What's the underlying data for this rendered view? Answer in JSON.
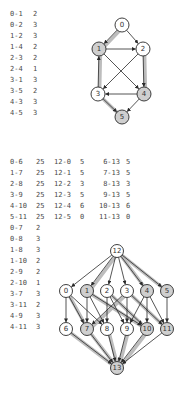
{
  "top": {
    "table": [
      {
        "edge": "0-1",
        "value": "2"
      },
      {
        "edge": "0-2",
        "value": "3"
      },
      {
        "edge": "1-2",
        "value": "3"
      },
      {
        "edge": "1-4",
        "value": "2"
      },
      {
        "edge": "2-3",
        "value": "2"
      },
      {
        "edge": "2-4",
        "value": "1"
      },
      {
        "edge": "3-1",
        "value": "3"
      },
      {
        "edge": "3-5",
        "value": "2"
      },
      {
        "edge": "4-3",
        "value": "3"
      },
      {
        "edge": "4-5",
        "value": "3"
      }
    ],
    "graph": {
      "nodes": [
        {
          "id": "0",
          "x": 122,
          "y": 25,
          "shaded": false
        },
        {
          "id": "1",
          "x": 99,
          "y": 49,
          "shaded": true
        },
        {
          "id": "2",
          "x": 143,
          "y": 49,
          "shaded": false
        },
        {
          "id": "3",
          "x": 98,
          "y": 94,
          "shaded": false
        },
        {
          "id": "4",
          "x": 144,
          "y": 94,
          "shaded": true
        },
        {
          "id": "5",
          "x": 122,
          "y": 117,
          "shaded": true
        }
      ],
      "edges": [
        {
          "from": "0",
          "to": "1",
          "highlight": true
        },
        {
          "from": "0",
          "to": "2",
          "highlight": false
        },
        {
          "from": "1",
          "to": "2",
          "highlight": false
        },
        {
          "from": "1",
          "to": "4",
          "highlight": false
        },
        {
          "from": "2",
          "to": "3",
          "highlight": false
        },
        {
          "from": "2",
          "to": "4",
          "highlight": true
        },
        {
          "from": "3",
          "to": "1",
          "highlight": true
        },
        {
          "from": "3",
          "to": "5",
          "highlight": true
        },
        {
          "from": "4",
          "to": "3",
          "highlight": false
        },
        {
          "from": "4",
          "to": "5",
          "highlight": false
        }
      ]
    }
  },
  "bottom": {
    "table_main": [
      [
        {
          "edge": "0-6",
          "value": "25"
        },
        {
          "edge": "12-0",
          "value": "5"
        },
        {
          "edge": "6-13",
          "value": "5"
        }
      ],
      [
        {
          "edge": "1-7",
          "value": "25"
        },
        {
          "edge": "12-1",
          "value": "5"
        },
        {
          "edge": "7-13",
          "value": "5"
        }
      ],
      [
        {
          "edge": "2-8",
          "value": "25"
        },
        {
          "edge": "12-2",
          "value": "3"
        },
        {
          "edge": "8-13",
          "value": "3"
        }
      ],
      [
        {
          "edge": "3-9",
          "value": "25"
        },
        {
          "edge": "12-3",
          "value": "5"
        },
        {
          "edge": "9-13",
          "value": "5"
        }
      ],
      [
        {
          "edge": "4-10",
          "value": "25"
        },
        {
          "edge": "12-4",
          "value": "6"
        },
        {
          "edge": "10-13",
          "value": "6"
        }
      ],
      [
        {
          "edge": "5-11",
          "value": "25"
        },
        {
          "edge": "12-5",
          "value": "0"
        },
        {
          "edge": "11-13",
          "value": "0"
        }
      ]
    ],
    "table_extra": [
      {
        "edge": "0-7",
        "value": "2"
      },
      {
        "edge": "0-8",
        "value": "3"
      },
      {
        "edge": "1-8",
        "value": "3"
      },
      {
        "edge": "1-10",
        "value": "2"
      },
      {
        "edge": "2-9",
        "value": "2"
      },
      {
        "edge": "2-10",
        "value": "1"
      },
      {
        "edge": "3-7",
        "value": "3"
      },
      {
        "edge": "3-11",
        "value": "2"
      },
      {
        "edge": "4-9",
        "value": "3"
      },
      {
        "edge": "4-11",
        "value": "3"
      }
    ],
    "graph": {
      "nodes": [
        {
          "id": "12",
          "x": 117,
          "y": 251,
          "shaded": false
        },
        {
          "id": "0",
          "x": 66,
          "y": 291,
          "shaded": false
        },
        {
          "id": "1",
          "x": 87,
          "y": 291,
          "shaded": true
        },
        {
          "id": "2",
          "x": 107,
          "y": 291,
          "shaded": false
        },
        {
          "id": "3",
          "x": 127,
          "y": 291,
          "shaded": false
        },
        {
          "id": "4",
          "x": 147,
          "y": 291,
          "shaded": true
        },
        {
          "id": "5",
          "x": 167,
          "y": 291,
          "shaded": true
        },
        {
          "id": "6",
          "x": 66,
          "y": 329,
          "shaded": false
        },
        {
          "id": "7",
          "x": 87,
          "y": 329,
          "shaded": true
        },
        {
          "id": "8",
          "x": 107,
          "y": 329,
          "shaded": false
        },
        {
          "id": "9",
          "x": 127,
          "y": 329,
          "shaded": false
        },
        {
          "id": "10",
          "x": 147,
          "y": 329,
          "shaded": true
        },
        {
          "id": "11",
          "x": 167,
          "y": 329,
          "shaded": true
        },
        {
          "id": "13",
          "x": 117,
          "y": 368,
          "shaded": true
        }
      ],
      "edges": [
        {
          "from": "12",
          "to": "0",
          "highlight": false
        },
        {
          "from": "12",
          "to": "1",
          "highlight": true
        },
        {
          "from": "12",
          "to": "2",
          "highlight": false
        },
        {
          "from": "12",
          "to": "3",
          "highlight": false
        },
        {
          "from": "12",
          "to": "4",
          "highlight": true
        },
        {
          "from": "12",
          "to": "5",
          "highlight": true
        },
        {
          "from": "0",
          "to": "6",
          "highlight": false
        },
        {
          "from": "1",
          "to": "7",
          "highlight": false
        },
        {
          "from": "2",
          "to": "8",
          "highlight": false
        },
        {
          "from": "3",
          "to": "9",
          "highlight": false
        },
        {
          "from": "4",
          "to": "10",
          "highlight": false
        },
        {
          "from": "5",
          "to": "11",
          "highlight": false
        },
        {
          "from": "0",
          "to": "7",
          "highlight": true
        },
        {
          "from": "0",
          "to": "8",
          "highlight": false
        },
        {
          "from": "1",
          "to": "8",
          "highlight": false
        },
        {
          "from": "1",
          "to": "10",
          "highlight": true
        },
        {
          "from": "2",
          "to": "9",
          "highlight": false
        },
        {
          "from": "2",
          "to": "10",
          "highlight": true
        },
        {
          "from": "3",
          "to": "7",
          "highlight": true
        },
        {
          "from": "3",
          "to": "11",
          "highlight": true
        },
        {
          "from": "4",
          "to": "9",
          "highlight": false
        },
        {
          "from": "4",
          "to": "11",
          "highlight": false
        },
        {
          "from": "6",
          "to": "13",
          "highlight": true
        },
        {
          "from": "7",
          "to": "13",
          "highlight": true
        },
        {
          "from": "8",
          "to": "13",
          "highlight": true
        },
        {
          "from": "9",
          "to": "13",
          "highlight": true
        },
        {
          "from": "10",
          "to": "13",
          "highlight": true
        },
        {
          "from": "11",
          "to": "13",
          "highlight": false
        }
      ]
    }
  },
  "colors": {
    "node_fill": "#ffffff",
    "node_shaded": "#cfcfcf",
    "stroke": "#2a2a2a",
    "highlight": "#bdbdbd",
    "text": "#4a4a4a"
  }
}
